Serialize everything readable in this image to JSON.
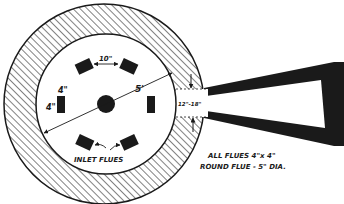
{
  "diagram": {
    "type": "plan-view-flue-layout",
    "colors": {
      "ink": "#1a1a1a",
      "paper": "#ffffff"
    },
    "labels": {
      "flue_spacing": "10\"",
      "flue_width": "4\"",
      "flue_height": "4\"",
      "chamber_diameter": "5'",
      "exit_width": "12\"-18\"",
      "inlet_flues": "INLET FLUES",
      "note_line1": "ALL FLUES 4\"x 4\"",
      "note_line2": "ROUND FLUE - 5\" DIA."
    },
    "parts": [
      "outer-wall-hatched",
      "inner-chamber",
      "round-flue",
      "inlet-flues",
      "exit-duct"
    ]
  }
}
